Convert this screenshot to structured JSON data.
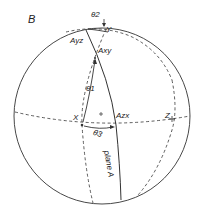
{
  "figure": {
    "panel_label": "B",
    "labels": {
      "theta2": "θ2",
      "y_axis": "Y",
      "a_yz": "Ayz",
      "a_xy": "Axy",
      "theta1": "θ1",
      "x_axis": "X",
      "theta3": "θ3",
      "a_zx": "Azx",
      "z_axis": "Z",
      "plane": "plane A"
    },
    "colors": {
      "stroke": "#333333",
      "background": "#ffffff"
    }
  }
}
